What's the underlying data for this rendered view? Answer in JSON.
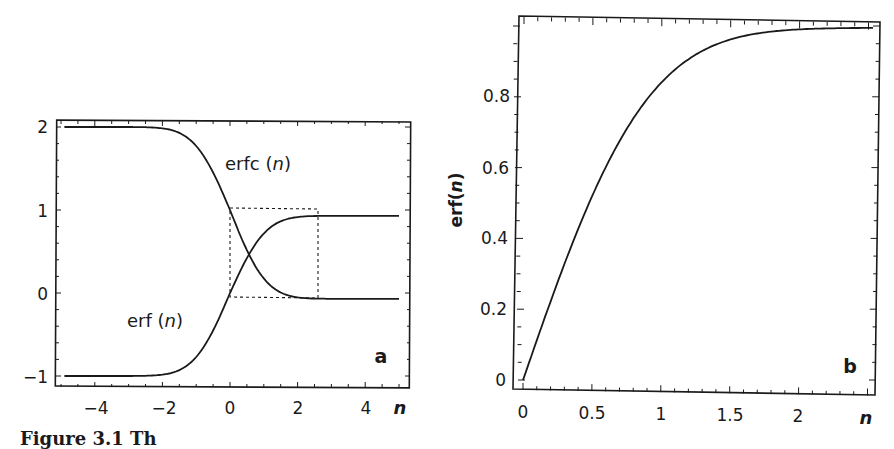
{
  "chart_data": [
    {
      "panel": "a",
      "type": "line",
      "title": "",
      "xlabel": "n",
      "ylabel": "",
      "xlim": [
        -5.2,
        5.3
      ],
      "ylim": [
        -1.1,
        2.05
      ],
      "x_ticks": [
        -4,
        -2,
        0,
        2,
        4
      ],
      "y_ticks": [
        -1,
        0,
        1,
        2
      ],
      "grid": false,
      "legend": null,
      "series": [
        {
          "name": "erfc (n)",
          "x": [
            -5,
            -2,
            -1.5,
            -1,
            -0.5,
            0,
            0.5,
            1,
            1.5,
            2,
            5
          ],
          "values": [
            2.0,
            1.995,
            1.966,
            1.843,
            1.52,
            1.0,
            0.48,
            0.157,
            0.034,
            0.005,
            0.0
          ]
        },
        {
          "name": "erf (n)",
          "x": [
            -5,
            -2,
            -1.5,
            -1,
            -0.5,
            0,
            0.5,
            1,
            1.5,
            2,
            5
          ],
          "values": [
            -1.0,
            -0.995,
            -0.966,
            -0.843,
            -0.52,
            0.0,
            0.52,
            0.843,
            0.966,
            0.995,
            1.0
          ]
        }
      ],
      "annotations": [
        {
          "text": "erfc (n)",
          "near": [
            1.2,
            1.55
          ]
        },
        {
          "text": "erf (n)",
          "near": [
            -1.6,
            -0.35
          ]
        },
        {
          "text": "dashed box",
          "x_range": [
            0,
            2.5
          ],
          "y_range": [
            0,
            1
          ]
        }
      ]
    },
    {
      "panel": "b",
      "type": "line",
      "title": "",
      "xlabel": "n",
      "ylabel": "erf(n)",
      "xlim": [
        -0.03,
        2.55
      ],
      "ylim": [
        -0.02,
        1.02
      ],
      "x_ticks": [
        0,
        0.5,
        1,
        1.5,
        2
      ],
      "y_ticks": [
        0,
        0.2,
        0.4,
        0.6,
        0.8
      ],
      "grid": false,
      "legend": null,
      "series": [
        {
          "name": "erf(n)",
          "x": [
            0,
            0.25,
            0.5,
            0.75,
            1.0,
            1.25,
            1.5,
            1.75,
            2.0,
            2.25,
            2.5
          ],
          "values": [
            0.0,
            0.276,
            0.52,
            0.711,
            0.843,
            0.923,
            0.966,
            0.987,
            0.995,
            0.999,
            1.0
          ]
        }
      ]
    }
  ],
  "panel_a": {
    "x_tick_labels": [
      "−4",
      "−2",
      "0",
      "2",
      "4"
    ],
    "y_tick_labels": [
      "−1",
      "0",
      "1",
      "2"
    ],
    "x_axis_label": "n",
    "label_erfc": "erfc (",
    "label_erf": "erf (",
    "label_var": "n",
    "label_close": ")",
    "panel_label": "a"
  },
  "panel_b": {
    "x_tick_labels": [
      "0",
      "0.5",
      "1",
      "1.5",
      "2"
    ],
    "y_tick_labels": [
      "0",
      "0.2",
      "0.4",
      "0.6",
      "0.8"
    ],
    "x_axis_label": "n",
    "y_axis_label_prefix": "erf(",
    "y_axis_label_var": "n",
    "y_axis_label_suffix": ")",
    "panel_label": "b"
  },
  "caption": {
    "text": "Figure 3.1  Th"
  }
}
